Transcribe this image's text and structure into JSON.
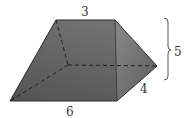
{
  "figure": {
    "type": "prism",
    "labels": {
      "top": "3",
      "bottom": "6",
      "depth": "4",
      "height": "5"
    },
    "colors": {
      "left_face": "#5e5e5e",
      "front_face": "#6b6b6b",
      "right_face": "#7a7a7a",
      "edge": "#2a2a2a",
      "hidden_edge": "#222222",
      "brace": "#555555",
      "text": "#333333"
    }
  }
}
